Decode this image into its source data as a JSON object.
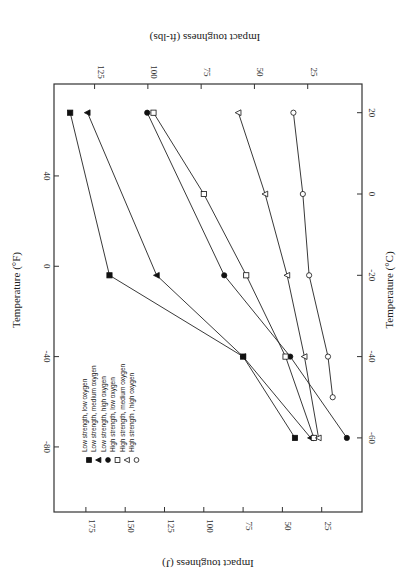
{
  "chart_data": {
    "type": "line",
    "orientation_note": "figure rendered rotated 180 degrees",
    "title": "",
    "xlabel_bottom": "Impact toughness (J)",
    "xlabel_top": "Impact toughness (ft-lbs)",
    "ylabel_left": "Temperature (°F)",
    "ylabel_right": "Temperature (°C)",
    "x_ticks_J": [
      175,
      150,
      125,
      100,
      75,
      50,
      25
    ],
    "x_ticks_ftlbs": [
      125,
      100,
      75,
      50,
      25
    ],
    "y_ticks_F": [
      40,
      0,
      -40,
      -80
    ],
    "y_ticks_C": [
      20,
      0,
      -20,
      -40,
      -60
    ],
    "xlim_J": [
      0,
      195
    ],
    "ylim_C": [
      -78,
      27
    ],
    "grid": false,
    "legend_position": "inside lower-left",
    "series": [
      {
        "name": "Low strength, low oxygen",
        "marker": "square-filled",
        "points": [
          {
            "c": 20,
            "j": 185
          },
          {
            "c": -20,
            "j": 160
          },
          {
            "c": -40,
            "j": 75
          },
          {
            "c": -60,
            "j": 42
          }
        ]
      },
      {
        "name": "Low strength, medium oxygen",
        "marker": "triangle-filled",
        "points": [
          {
            "c": 20,
            "j": 174
          },
          {
            "c": -20,
            "j": 130
          },
          {
            "c": -40,
            "j": 75
          },
          {
            "c": -60,
            "j": 32
          }
        ]
      },
      {
        "name": "Low strength, high oxygen",
        "marker": "circle-filled",
        "points": [
          {
            "c": 20,
            "j": 136
          },
          {
            "c": -20,
            "j": 87
          },
          {
            "c": -40,
            "j": 45
          },
          {
            "c": -60,
            "j": 9
          }
        ]
      },
      {
        "name": "High strength, low oxygen",
        "marker": "square-open",
        "points": [
          {
            "c": 20,
            "j": 132
          },
          {
            "c": 0,
            "j": 100
          },
          {
            "c": -20,
            "j": 73
          },
          {
            "c": -40,
            "j": 48
          },
          {
            "c": -60,
            "j": 30
          }
        ]
      },
      {
        "name": "High strength, medium oxygen",
        "marker": "triangle-open",
        "points": [
          {
            "c": 20,
            "j": 78
          },
          {
            "c": 0,
            "j": 61
          },
          {
            "c": -20,
            "j": 47
          },
          {
            "c": -40,
            "j": 36
          },
          {
            "c": -60,
            "j": 27
          }
        ]
      },
      {
        "name": "High strength , high oxygen",
        "marker": "circle-open",
        "points": [
          {
            "c": 20,
            "j": 43
          },
          {
            "c": 0,
            "j": 37
          },
          {
            "c": -20,
            "j": 33
          },
          {
            "c": -40,
            "j": 21
          },
          {
            "c": -50,
            "j": 18
          }
        ]
      }
    ]
  }
}
